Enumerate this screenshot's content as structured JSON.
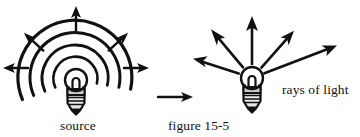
{
  "figure": {
    "caption": "figure 15-5",
    "background_color": "#ffffff",
    "ink_color": "#111111",
    "width": 360,
    "height": 137
  },
  "left_panel": {
    "label": "source",
    "label_x": 78,
    "label_y": 130,
    "description": "light bulb emitting concentric spherical wavefronts with outward arrows",
    "bulb": {
      "center_x": 76,
      "center_y": 80,
      "globe_radius": 11,
      "collar_color": "#c9c9c9",
      "base_color": "#e8e8e8"
    },
    "wavefronts": {
      "count": 4,
      "radii": [
        22,
        33,
        45,
        57
      ],
      "start_angle_deg": 160,
      "end_angle_deg": 380,
      "stroke_width": 2.6
    },
    "arrows": [
      {
        "name": "arrow-up",
        "angle_deg": 270,
        "inner_r": 48,
        "outer_r": 70
      },
      {
        "name": "arrow-up-left",
        "angle_deg": 222,
        "inner_r": 44,
        "outer_r": 66
      },
      {
        "name": "arrow-up-right",
        "angle_deg": 318,
        "inner_r": 44,
        "outer_r": 66
      },
      {
        "name": "arrow-left",
        "angle_deg": 180,
        "inner_r": 48,
        "outer_r": 74
      },
      {
        "name": "arrow-right",
        "angle_deg": 0,
        "inner_r": 48,
        "outer_r": 74
      }
    ]
  },
  "transition_arrow": {
    "name": "implies-arrow",
    "x1": 158,
    "y1": 97,
    "x2": 193,
    "y2": 97,
    "direction": "right"
  },
  "right_panel": {
    "label": "rays of light",
    "label_x": 282,
    "label_y": 94,
    "description": "light bulb emitting straight radial rays of light",
    "bulb": {
      "center_x": 252,
      "center_y": 78,
      "globe_radius": 11,
      "collar_color": "#c9c9c9",
      "base_color": "#e8e8e8"
    },
    "rays": [
      {
        "name": "ray-up",
        "angle_deg": 270,
        "inner_r": 14,
        "outer_r": 62
      },
      {
        "name": "ray-up-left",
        "angle_deg": 230,
        "inner_r": 14,
        "outer_r": 62
      },
      {
        "name": "ray-left",
        "angle_deg": 198,
        "inner_r": 14,
        "outer_r": 66
      },
      {
        "name": "ray-up-right",
        "angle_deg": 312,
        "inner_r": 14,
        "outer_r": 60
      },
      {
        "name": "ray-right",
        "angle_deg": 338,
        "inner_r": 14,
        "outer_r": 76
      }
    ]
  }
}
